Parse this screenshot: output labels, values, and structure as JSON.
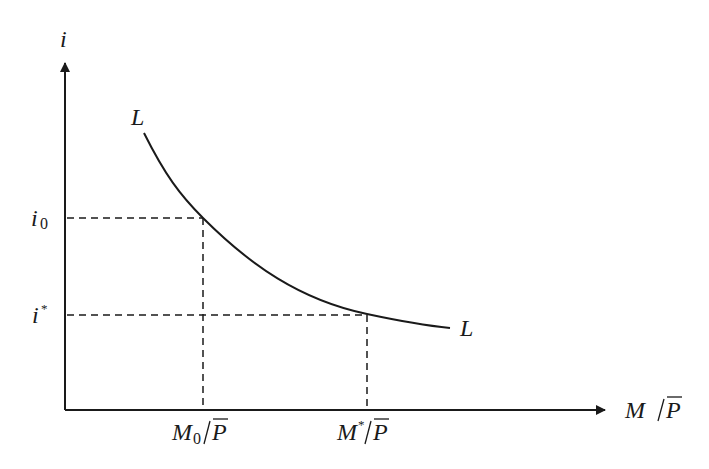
{
  "diagram": {
    "type": "money-demand-curve",
    "y_axis": {
      "label": "i"
    },
    "x_axis": {
      "label_main": "M",
      "label_denominator": "P"
    },
    "curve": {
      "name": "L",
      "start_label": "L",
      "end_label": "L"
    },
    "y_ticks": [
      {
        "label": "i",
        "subscript": "0",
        "superscript": ""
      },
      {
        "label": "i",
        "subscript": "",
        "superscript": "*"
      }
    ],
    "x_ticks": [
      {
        "label": "M",
        "subscript": "0",
        "superscript": "",
        "denominator": "P"
      },
      {
        "label": "M",
        "subscript": "",
        "superscript": "*",
        "denominator": "P"
      }
    ],
    "colors": {
      "ink": "#1a1a1a",
      "background": "#ffffff"
    }
  }
}
